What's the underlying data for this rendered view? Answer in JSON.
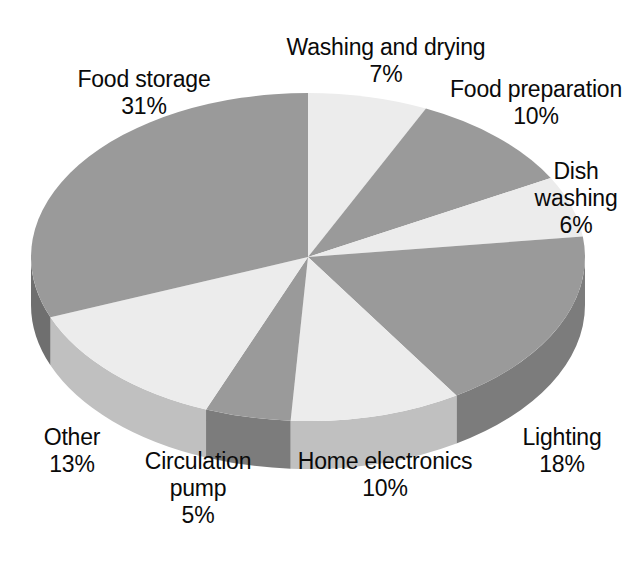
{
  "chart_data": {
    "type": "pie",
    "title": "",
    "subtitle": "",
    "xlabel": "",
    "ylabel": "",
    "legend_position": "none",
    "grid": false,
    "style": "3d-pie",
    "units": "%",
    "start_angle_deg": 0,
    "direction": "clockwise",
    "categories": [
      "Washing and drying",
      "Food preparation",
      "Dish washing",
      "Lighting",
      "Home electronics",
      "Circulation pump",
      "Other",
      "Food storage"
    ],
    "values": [
      7,
      10,
      6,
      18,
      10,
      5,
      13,
      31
    ],
    "total": 100,
    "slices": [
      {
        "label": "Washing and drying",
        "value": 7,
        "value_text": "7%",
        "color": "#ececec",
        "side_color": "#c0c0c0",
        "start_pct": 0,
        "end_pct": 7
      },
      {
        "label": "Food preparation",
        "value": 10,
        "value_text": "10%",
        "color": "#9a9a9a",
        "side_color": "#7c7c7c",
        "start_pct": 7,
        "end_pct": 17
      },
      {
        "label": "Dish washing",
        "value": 6,
        "value_text": "6%",
        "color": "#ececec",
        "side_color": "#c0c0c0",
        "start_pct": 17,
        "end_pct": 23
      },
      {
        "label": "Lighting",
        "value": 18,
        "value_text": "18%",
        "color": "#9a9a9a",
        "side_color": "#7c7c7c",
        "start_pct": 23,
        "end_pct": 41
      },
      {
        "label": "Home electronics",
        "value": 10,
        "value_text": "10%",
        "color": "#ececec",
        "side_color": "#c0c0c0",
        "start_pct": 41,
        "end_pct": 51
      },
      {
        "label": "Circulation pump",
        "value": 5,
        "value_text": "5%",
        "color": "#9a9a9a",
        "side_color": "#7c7c7c",
        "start_pct": 51,
        "end_pct": 56
      },
      {
        "label": "Other",
        "value": 13,
        "value_text": "13%",
        "color": "#ececec",
        "side_color": "#c0c0c0",
        "start_pct": 56,
        "end_pct": 69
      },
      {
        "label": "Food storage",
        "value": 31,
        "value_text": "31%",
        "color": "#9a9a9a",
        "side_color": "#6f6f6f",
        "start_pct": 69,
        "end_pct": 100
      }
    ]
  },
  "labels": {
    "washing_and_drying": {
      "name": "Washing and drying",
      "pct": "7%"
    },
    "food_preparation": {
      "name": "Food preparation",
      "pct": "10%"
    },
    "dish_washing_l1": "Dish",
    "dish_washing_l2": "washing",
    "dish_washing_pct": "6%",
    "lighting": {
      "name": "Lighting",
      "pct": "18%"
    },
    "home_electronics": {
      "name": "Home electronics",
      "pct": "10%"
    },
    "circulation_l1": "Circulation",
    "circulation_l2": "pump",
    "circulation_pct": "5%",
    "other": {
      "name": "Other",
      "pct": "13%"
    },
    "food_storage": {
      "name": "Food storage",
      "pct": "31%"
    }
  },
  "colors": {
    "background": "#ffffff",
    "slice_light": "#ececec",
    "slice_dark": "#9a9a9a",
    "wall_light": "#c0c0c0",
    "wall_dark": "#7c7c7c",
    "text": "#0a0a0a"
  },
  "geometry": {
    "center_x": 308,
    "center_y": 257,
    "radius_x": 277,
    "radius_y": 164,
    "depth": 48
  }
}
